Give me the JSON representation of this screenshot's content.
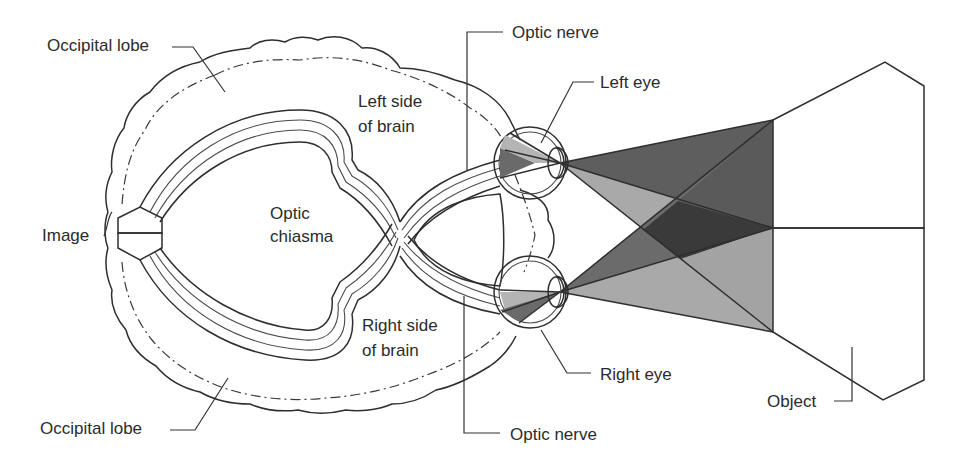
{
  "diagram": {
    "labels": {
      "occipital_lobe_top": "Occipital lobe",
      "occipital_lobe_bottom": "Occipital lobe",
      "left_side_line1": "Left side",
      "left_side_line2": "of brain",
      "right_side_line1": "Right side",
      "right_side_line2": "of brain",
      "optic_line1": "Optic",
      "optic_line2": "chiasma",
      "image": "Image",
      "optic_nerve_top": "Optic nerve",
      "optic_nerve_bottom": "Optic nerve",
      "left_eye": "Left eye",
      "right_eye": "Right eye",
      "object": "Object"
    },
    "colors": {
      "dark_gray": "#5e5e5e",
      "light_gray": "#a9a9a9",
      "darkest": "#3a3a3a",
      "eye_light": "#b4b4b4",
      "eye_dark": "#6a6a6a",
      "line": "#2e2e2e"
    }
  }
}
